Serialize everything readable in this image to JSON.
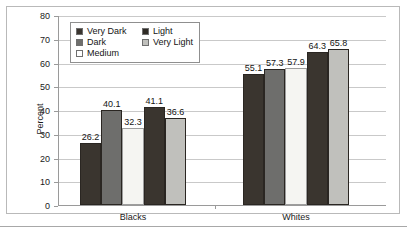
{
  "chart_data": {
    "type": "bar",
    "title": "",
    "xlabel": "",
    "ylabel": "Percent",
    "ylim": [
      0,
      80
    ],
    "yticks": [
      0,
      10,
      20,
      30,
      40,
      50,
      60,
      70,
      80
    ],
    "ytick_labels": [
      "0",
      "10",
      "20",
      "30",
      "40",
      "50",
      "60",
      "70",
      "80"
    ],
    "grid": true,
    "legend_position": "upper-left-inside",
    "categories": [
      "Blacks",
      "Whites"
    ],
    "series": [
      {
        "name": "Very Dark",
        "values": [
          26.2,
          55.1
        ],
        "color": "#3a352f"
      },
      {
        "name": "Dark",
        "values": [
          40.1,
          57.3
        ],
        "color": "#6e6e6c"
      },
      {
        "name": "Medium",
        "values": [
          32.3,
          57.9
        ],
        "color": "#f5f5f2"
      },
      {
        "name": "Light",
        "values": [
          41.1,
          64.3
        ],
        "color": "#3a352f"
      },
      {
        "name": "Very Light",
        "values": [
          36.6,
          65.8
        ],
        "color": "#c0c0bc"
      }
    ],
    "data_labels": {
      "Blacks": [
        "26.2",
        "40.1",
        "32.3",
        "41.1",
        "36.6"
      ],
      "Whites": [
        "55.1",
        "57.3",
        "57.9",
        "64.3",
        "65.8"
      ]
    }
  },
  "legend": {
    "entries": [
      {
        "label": "Very Dark",
        "swatch": "#3a352f"
      },
      {
        "label": "Dark",
        "swatch": "#6e6e6c"
      },
      {
        "label": "Medium",
        "swatch": "#ffffff"
      },
      {
        "label": "Light",
        "swatch": "#2e2a25"
      },
      {
        "label": "Very Light",
        "swatch": "#c0c0bc"
      }
    ]
  }
}
